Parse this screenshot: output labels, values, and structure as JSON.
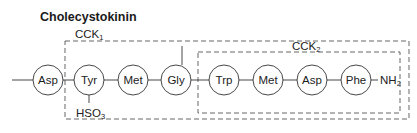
{
  "title": "Cholecystokinin",
  "groups": [
    {
      "name": "CCK",
      "sub": "1"
    },
    {
      "name": "CCK",
      "sub": "2"
    }
  ],
  "residues": [
    "Asp",
    "Tyr",
    "Met",
    "Gly",
    "Trp",
    "Met",
    "Asp",
    "Phe"
  ],
  "c_terminus": {
    "base": "NH",
    "sub": "2"
  },
  "modification": {
    "residue": "Tyr",
    "base": "HSO",
    "sub": "3"
  }
}
